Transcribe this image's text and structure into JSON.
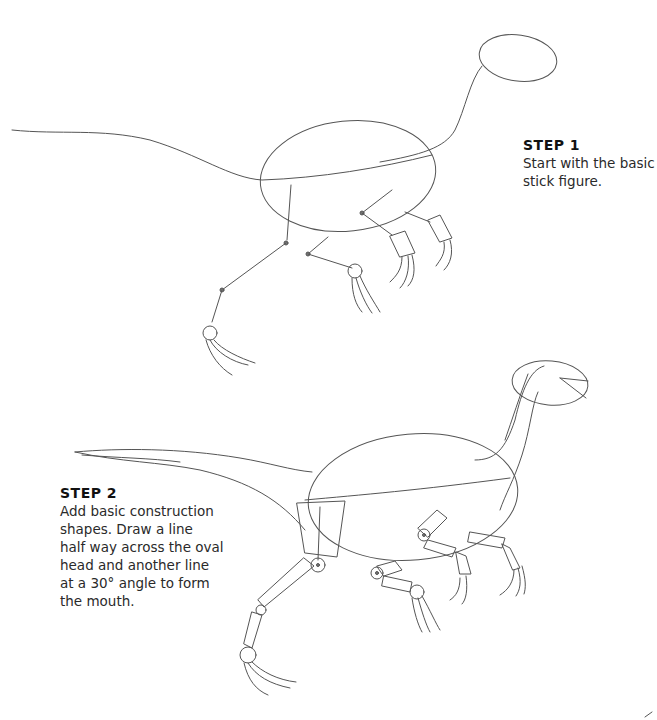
{
  "page": {
    "type": "drawing-tutorial"
  },
  "steps": [
    {
      "title": "STEP 1",
      "text": "Start with the basic\nstick figure."
    },
    {
      "title": "STEP 2",
      "text": "Add basic construction\nshapes. Draw a line\nhalf way across the oval\nhead and another line\nat a 30° angle to form\nthe mouth."
    }
  ],
  "illustrations": [
    {
      "name": "step-1-stick-figure",
      "elements": [
        "head-oval",
        "neck-line",
        "body-oval",
        "tail-line",
        "legs-stick",
        "arms-stick",
        "feet-claws"
      ]
    },
    {
      "name": "step-2-construction-shapes",
      "elements": [
        "head-oval",
        "mouth-lines",
        "neck-shape",
        "body-oval",
        "tail-shape",
        "thigh-shape",
        "leg-segments",
        "arm-segments",
        "claws"
      ]
    }
  ],
  "colors": {
    "background": "#ffffff",
    "line": "#555555",
    "text": "#222222"
  }
}
